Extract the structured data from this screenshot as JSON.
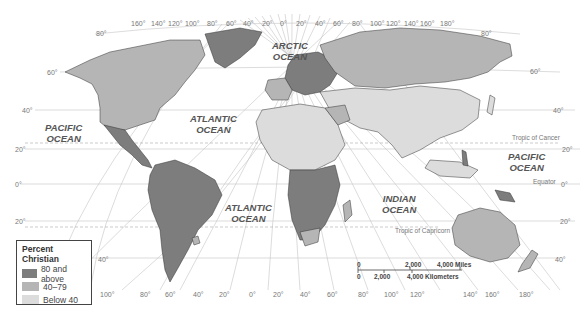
{
  "map": {
    "title": "Percent Christian",
    "colors": {
      "high": "#7d7d7d",
      "mid": "#b5b5b5",
      "low": "#dcdcdc",
      "water": "#ffffff",
      "grid": "#bdbdbd",
      "border": "#333333"
    },
    "legend": {
      "title": "Percent Christian",
      "items": [
        {
          "label": "80 and above",
          "color": "#7d7d7d"
        },
        {
          "label": "40–79",
          "color": "#b5b5b5"
        },
        {
          "label": "Below 40",
          "color": "#dcdcdc"
        }
      ]
    },
    "oceans": {
      "arctic": "ARCTIC OCEAN",
      "arctic_line1": "ARCTIC",
      "arctic_line2": "OCEAN",
      "pacific_west_line1": "PACIFIC",
      "pacific_west_line2": "OCEAN",
      "atlantic_north_line1": "ATLANTIC",
      "atlantic_north_line2": "OCEAN",
      "atlantic_south_line1": "ATLANTIC",
      "atlantic_south_line2": "OCEAN",
      "indian_line1": "INDIAN",
      "indian_line2": "OCEAN",
      "pacific_east_line1": "PACIFIC",
      "pacific_east_line2": "OCEAN"
    },
    "reference_lines": {
      "tropic_cancer": "Tropic of Cancer",
      "equator": "Equator",
      "tropic_capricorn": "Tropic of Capricorn"
    },
    "top_longitudes": [
      "160°",
      "140°",
      "120°",
      "100°",
      "80°",
      "60°",
      "40°",
      "20°",
      "0°",
      "20°",
      "40°",
      "60°",
      "80°",
      "100°",
      "120°",
      "140°",
      "160°",
      "180°"
    ],
    "bottom_longitudes": [
      "160°",
      "140°",
      "120°",
      "100°",
      "80°",
      "60°",
      "40°",
      "20°",
      "0°",
      "20°",
      "40°",
      "60°",
      "80°",
      "100°",
      "120°",
      "140°",
      "160°",
      "180°"
    ],
    "left_latitudes": [
      "80°",
      "60°",
      "40°",
      "20°",
      "0°",
      "20°",
      "40°"
    ],
    "right_latitudes": [
      "80°",
      "60°",
      "40°",
      "20°",
      "0°",
      "20°",
      "40°"
    ],
    "scale": {
      "miles_zero": "0",
      "miles_mid": "2,000",
      "miles_end": "4,000 Miles",
      "km_zero": "0",
      "km_mid": "2,000",
      "km_end": "4,000 Kilometers"
    }
  }
}
